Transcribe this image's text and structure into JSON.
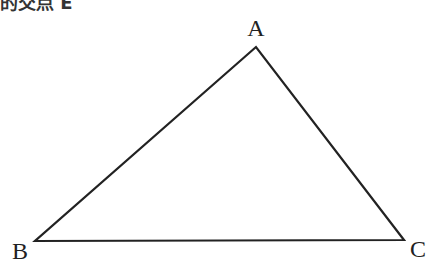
{
  "header": {
    "cut_text": "的交点 E"
  },
  "diagram": {
    "type": "triangle",
    "stroke_color": "#222222",
    "vertices": [
      {
        "name": "A",
        "x": 256,
        "y": 47,
        "label_x": 256,
        "label_y": 36
      },
      {
        "name": "B",
        "x": 35,
        "y": 241,
        "label_x": 20,
        "label_y": 259
      },
      {
        "name": "C",
        "x": 404,
        "y": 240,
        "label_x": 418,
        "label_y": 257
      }
    ],
    "edges": [
      "AB",
      "BC",
      "CA"
    ]
  }
}
